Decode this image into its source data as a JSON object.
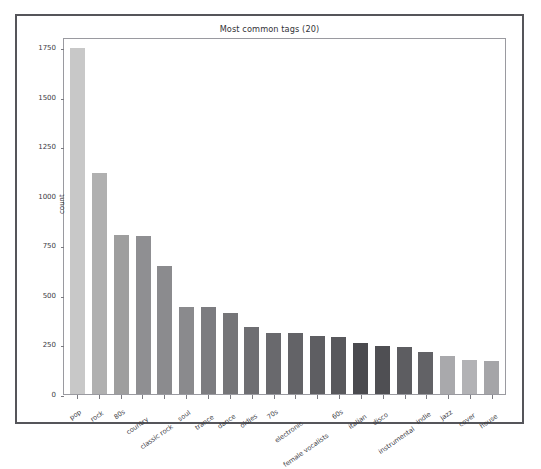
{
  "chart_data": {
    "type": "bar",
    "title": "Most common tags (20)",
    "xlabel": "",
    "ylabel": "count",
    "ylim": [
      0,
      1800
    ],
    "yticks": [
      0,
      250,
      500,
      750,
      1000,
      1250,
      1500,
      1750
    ],
    "ytick_labels": [
      "0",
      "250",
      "500",
      "750",
      "1000",
      "1250",
      "1500",
      "1750"
    ],
    "grid": false,
    "legend": null,
    "categories": [
      "pop",
      "rock",
      "80s",
      "country",
      "classic rock",
      "soul",
      "trance",
      "dance",
      "oldies",
      "70s",
      "electronic",
      "female vocalists",
      "60s",
      "italian",
      "disco",
      "instrumental",
      "indie",
      "jazz",
      "cover",
      "house"
    ],
    "values": [
      1745,
      1115,
      800,
      795,
      645,
      440,
      437,
      410,
      340,
      310,
      308,
      293,
      285,
      255,
      240,
      235,
      210,
      190,
      170,
      165
    ],
    "bar_colors": [
      "#c8c8c8",
      "#b0b0b0",
      "#9e9e9e",
      "#8f8f92",
      "#8b8b8e",
      "#8a8a8d",
      "#7c7c80",
      "#757578",
      "#6e6e72",
      "#69696d",
      "#636367",
      "#5e5e62",
      "#58585c",
      "#4a4a4e",
      "#4f4f53",
      "#5d5d61",
      "#626266",
      "#a9a9ac",
      "#b2b2b5",
      "#a5a5a8"
    ]
  },
  "figure": {
    "frame_color": "#55555a",
    "axes_color": "#9a9aa0",
    "text_color": "#3a3a3f",
    "background": "#ffffff"
  }
}
